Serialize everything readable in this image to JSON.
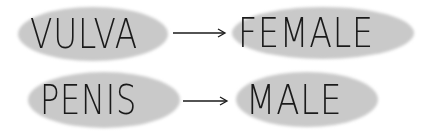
{
  "diagram": {
    "rows": [
      {
        "source": "VULVA",
        "target": "FEMALE",
        "arrow": "arrow-right"
      },
      {
        "source": "PENIS",
        "target": "MALE",
        "arrow": "arrow-right"
      }
    ],
    "colors": {
      "blob": "#c9c9c9",
      "ink": "#1a1a1a",
      "background": "#ffffff"
    }
  }
}
